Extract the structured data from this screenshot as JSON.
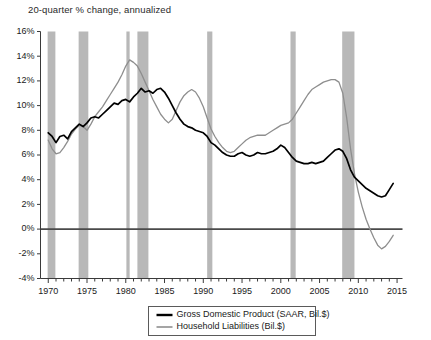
{
  "chart_data": {
    "type": "line",
    "title": "20-quarter % change, annualized",
    "xlabel": "",
    "ylabel": "",
    "xlim": [
      1969.0,
      2015.7
    ],
    "ylim": [
      -4,
      16
    ],
    "grid": false,
    "legend_position": "bottom-center",
    "y_ticks": [
      -4,
      -2,
      0,
      2,
      4,
      6,
      8,
      10,
      12,
      14,
      16
    ],
    "y_tick_labels": [
      "-4%",
      "-2%",
      "0%",
      "2%",
      "4%",
      "6%",
      "8%",
      "10%",
      "12%",
      "14%",
      "16%"
    ],
    "x_ticks": [
      1970,
      1975,
      1980,
      1985,
      1990,
      1995,
      2000,
      2005,
      2010,
      2015
    ],
    "x_tick_labels": [
      "1970",
      "1975",
      "1980",
      "1985",
      "1990",
      "1995",
      "2000",
      "2005",
      "2010",
      "2015"
    ],
    "x_minor_tick_interval": 1,
    "zero_line": 0,
    "recession_bands": [
      {
        "label": "1969-1970 recession",
        "start": 1969.92,
        "end": 1970.92
      },
      {
        "label": "1973-1975 recession",
        "start": 1973.92,
        "end": 1975.17
      },
      {
        "label": "1980 recession",
        "start": 1980.08,
        "end": 1980.5
      },
      {
        "label": "1981-1982 recession",
        "start": 1981.5,
        "end": 1982.92
      },
      {
        "label": "1990-1991 recession",
        "start": 1990.5,
        "end": 1991.17
      },
      {
        "label": "2001 recession",
        "start": 2001.25,
        "end": 2001.92
      },
      {
        "label": "2007-2009 recession",
        "start": 2007.92,
        "end": 2009.5
      }
    ],
    "series": [
      {
        "name": "Gross Domestic Product (SAAR, Bil.$)",
        "color": "#000000",
        "x": [
          1970.0,
          1970.5,
          1971.0,
          1971.5,
          1972.0,
          1972.5,
          1973.0,
          1973.5,
          1974.0,
          1974.5,
          1975.0,
          1975.5,
          1976.0,
          1976.5,
          1977.0,
          1977.5,
          1978.0,
          1978.5,
          1979.0,
          1979.5,
          1980.0,
          1980.5,
          1981.0,
          1981.5,
          1982.0,
          1982.5,
          1983.0,
          1983.5,
          1984.0,
          1984.5,
          1985.0,
          1985.5,
          1986.0,
          1986.5,
          1987.0,
          1987.5,
          1988.0,
          1988.5,
          1989.0,
          1989.5,
          1990.0,
          1990.5,
          1991.0,
          1991.5,
          1992.0,
          1992.5,
          1993.0,
          1993.5,
          1994.0,
          1994.5,
          1995.0,
          1995.5,
          1996.0,
          1996.5,
          1997.0,
          1997.5,
          1998.0,
          1998.5,
          1999.0,
          1999.5,
          2000.0,
          2000.5,
          2001.0,
          2001.5,
          2002.0,
          2002.5,
          2003.0,
          2003.5,
          2004.0,
          2004.5,
          2005.0,
          2005.5,
          2006.0,
          2006.5,
          2007.0,
          2007.5,
          2008.0,
          2008.5,
          2009.0,
          2009.5,
          2010.0,
          2010.5,
          2011.0,
          2011.5,
          2012.0,
          2012.5,
          2013.0,
          2013.5,
          2014.0,
          2014.5
        ],
        "y": [
          7.8,
          7.5,
          7.0,
          7.5,
          7.6,
          7.3,
          7.9,
          8.2,
          8.5,
          8.3,
          8.6,
          9.0,
          9.1,
          9.0,
          9.3,
          9.6,
          9.9,
          10.2,
          10.1,
          10.4,
          10.5,
          10.3,
          10.7,
          11.0,
          11.4,
          11.1,
          11.2,
          11.0,
          11.3,
          11.4,
          11.1,
          10.6,
          10.0,
          9.4,
          8.9,
          8.5,
          8.3,
          8.2,
          8.0,
          7.9,
          7.8,
          7.5,
          7.0,
          6.8,
          6.5,
          6.2,
          6.0,
          5.9,
          5.9,
          6.1,
          6.2,
          6.0,
          5.9,
          6.0,
          6.2,
          6.1,
          6.1,
          6.2,
          6.3,
          6.5,
          6.8,
          6.6,
          6.2,
          5.8,
          5.5,
          5.4,
          5.3,
          5.3,
          5.4,
          5.3,
          5.4,
          5.5,
          5.8,
          6.1,
          6.4,
          6.5,
          6.3,
          5.7,
          4.8,
          4.2,
          3.9,
          3.6,
          3.3,
          3.1,
          2.9,
          2.7,
          2.6,
          2.7,
          3.2,
          3.7
        ]
      },
      {
        "name": "Household Liabilities (Bil.$)",
        "color": "#8e8e8e",
        "x": [
          1970.0,
          1970.5,
          1971.0,
          1971.5,
          1972.0,
          1972.5,
          1973.0,
          1973.5,
          1974.0,
          1974.5,
          1975.0,
          1975.5,
          1976.0,
          1976.5,
          1977.0,
          1977.5,
          1978.0,
          1978.5,
          1979.0,
          1979.5,
          1980.0,
          1980.5,
          1981.0,
          1981.5,
          1982.0,
          1982.5,
          1983.0,
          1983.5,
          1984.0,
          1984.5,
          1985.0,
          1985.5,
          1986.0,
          1986.5,
          1987.0,
          1987.5,
          1988.0,
          1988.5,
          1989.0,
          1989.5,
          1990.0,
          1990.5,
          1991.0,
          1991.5,
          1992.0,
          1992.5,
          1993.0,
          1993.5,
          1994.0,
          1994.5,
          1995.0,
          1995.5,
          1996.0,
          1996.5,
          1997.0,
          1997.5,
          1998.0,
          1998.5,
          1999.0,
          1999.5,
          2000.0,
          2000.5,
          2001.0,
          2001.5,
          2002.0,
          2002.5,
          2003.0,
          2003.5,
          2004.0,
          2004.5,
          2005.0,
          2005.5,
          2006.0,
          2006.5,
          2007.0,
          2007.5,
          2008.0,
          2008.5,
          2009.0,
          2009.5,
          2010.0,
          2010.5,
          2011.0,
          2011.5,
          2012.0,
          2012.5,
          2013.0,
          2013.5,
          2014.0,
          2014.5
        ],
        "y": [
          7.2,
          6.5,
          6.1,
          6.2,
          6.6,
          7.1,
          7.7,
          8.1,
          8.4,
          8.3,
          8.0,
          8.5,
          9.1,
          9.5,
          9.9,
          10.4,
          10.9,
          11.4,
          11.9,
          12.5,
          13.2,
          13.7,
          13.5,
          13.2,
          12.6,
          11.9,
          11.2,
          10.5,
          9.9,
          9.3,
          8.9,
          8.6,
          8.9,
          9.6,
          10.3,
          10.8,
          11.1,
          11.3,
          11.1,
          10.6,
          9.9,
          9.0,
          8.1,
          7.5,
          7.0,
          6.6,
          6.3,
          6.2,
          6.3,
          6.6,
          6.9,
          7.2,
          7.4,
          7.5,
          7.6,
          7.6,
          7.6,
          7.8,
          8.0,
          8.2,
          8.4,
          8.5,
          8.6,
          8.9,
          9.4,
          9.9,
          10.4,
          10.9,
          11.3,
          11.5,
          11.7,
          11.9,
          12.0,
          12.1,
          12.1,
          11.9,
          11.0,
          9.0,
          6.5,
          4.5,
          3.0,
          1.8,
          0.8,
          0.0,
          -0.7,
          -1.3,
          -1.6,
          -1.4,
          -1.0,
          -0.5
        ]
      }
    ]
  },
  "legend": {
    "entries": [
      {
        "label": "Gross Domestic Product (SAAR, Bil.$)",
        "style": "solid-black"
      },
      {
        "label": "Household Liabilities (Bil.$)",
        "style": "solid-gray"
      }
    ]
  },
  "colors": {
    "gdp_line": "#000000",
    "household_line": "#8e8e8e",
    "recession_band": "#b8b8b8",
    "axis": "#3a3a3a",
    "background": "#ffffff"
  }
}
